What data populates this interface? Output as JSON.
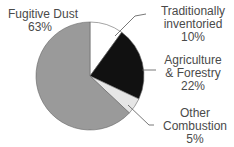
{
  "chart_data": {
    "type": "pie",
    "title": "",
    "start_angle": "12 o'clock",
    "direction": "clockwise",
    "slices": [
      {
        "label": "Traditionally inventoried",
        "value": 10,
        "color": "#ffffff"
      },
      {
        "label": "Agriculture & Forestry",
        "value": 22,
        "color": "#111111"
      },
      {
        "label": "Other Combustion",
        "value": 5,
        "color": "#e6e6e6"
      },
      {
        "label": "Fugitive Dust",
        "value": 63,
        "color": "#9a9a9a"
      }
    ]
  },
  "labels": {
    "fugitive": {
      "line1": "Fugitive Dust",
      "pct": "63%"
    },
    "traditional": {
      "line1": "Traditionally",
      "line2": "inventoried",
      "pct": "10%"
    },
    "agri": {
      "line1": "Agriculture",
      "line2": "& Forestry",
      "pct": "22%"
    },
    "other": {
      "line1": "Other",
      "line2": "Combustion",
      "pct": "5%"
    }
  }
}
